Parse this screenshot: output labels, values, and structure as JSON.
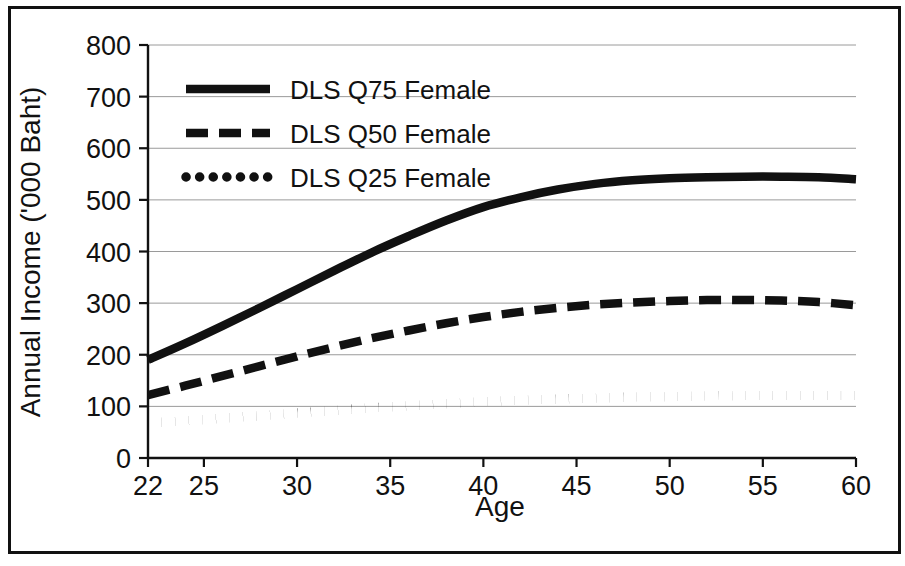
{
  "figure": {
    "background_color": "#ffffff",
    "ink_color": "#111111",
    "grid_color": "#9a9a9a",
    "has_border_frame": true
  },
  "chart_data": {
    "type": "line",
    "title": "",
    "subtitle": "",
    "xlabel": "Age",
    "ylabel": "Annual Income ('000 Baht)",
    "xlim": [
      22,
      60
    ],
    "ylim": [
      0,
      800
    ],
    "xticks": [
      22,
      25,
      30,
      35,
      40,
      45,
      50,
      55,
      60
    ],
    "xtick_labels": [
      "22",
      "25",
      "30",
      "35",
      "40",
      "45",
      "50",
      "55",
      "60"
    ],
    "yticks": [
      0,
      100,
      200,
      300,
      400,
      500,
      600,
      700,
      800
    ],
    "ytick_labels": [
      "0",
      "100",
      "200",
      "300",
      "400",
      "500",
      "600",
      "700",
      "800"
    ],
    "grid": true,
    "grid_axis": "y",
    "legend_position": "upper left",
    "x": [
      22,
      24,
      26,
      28,
      30,
      32,
      34,
      36,
      38,
      40,
      42,
      44,
      46,
      48,
      50,
      52,
      54,
      56,
      58,
      60
    ],
    "series": [
      {
        "name": "DLS Q75 Female",
        "style": "solid",
        "color": "#111111",
        "values": [
          190,
          222,
          256,
          291,
          327,
          363,
          398,
          430,
          460,
          486,
          505,
          520,
          531,
          538,
          542,
          544,
          545,
          545,
          544,
          540
        ]
      },
      {
        "name": "DLS Q50 Female",
        "style": "dashed",
        "color": "#111111",
        "values": [
          122,
          140,
          159,
          178,
          197,
          215,
          232,
          247,
          261,
          273,
          283,
          291,
          297,
          301,
          304,
          306,
          306,
          305,
          302,
          296
        ]
      },
      {
        "name": "DLS Q25 Female",
        "style": "dotted",
        "color": "#111111",
        "values": [
          68,
          72,
          77,
          82,
          87,
          92,
          97,
          101,
          105,
          109,
          112,
          114,
          116,
          118,
          119,
          120,
          121,
          121,
          121,
          121
        ]
      }
    ]
  },
  "legend": {
    "entries": [
      {
        "label": "DLS Q75 Female",
        "style": "solid"
      },
      {
        "label": "DLS Q50 Female",
        "style": "dashed"
      },
      {
        "label": "DLS Q25 Female",
        "style": "dotted"
      }
    ]
  }
}
